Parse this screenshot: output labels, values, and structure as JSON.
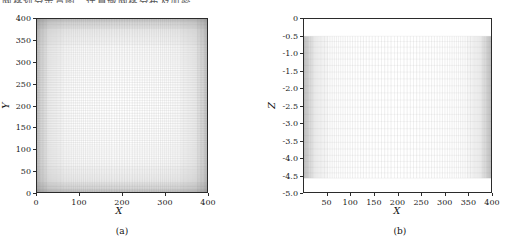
{
  "figure": {
    "top_cropped_text": "网格划分示意图，计算域网格分布及加密",
    "background": "#ffffff",
    "line_color": "#2b2b2b",
    "mesh_color": "#6b6b6b"
  },
  "chart_data": [
    {
      "type": "line",
      "panel": "a",
      "caption": "(a)",
      "title": "",
      "subtitle": "",
      "xlabel": "X",
      "ylabel": "Y",
      "xlim": [
        0,
        400
      ],
      "ylim": [
        0,
        400
      ],
      "xticks": [
        0,
        100,
        200,
        300,
        400
      ],
      "xtick_labels": [
        "0",
        "100",
        "200",
        "300",
        "400"
      ],
      "yticks": [
        0,
        50,
        100,
        150,
        200,
        250,
        300,
        350,
        400
      ],
      "ytick_labels": [
        "0",
        "50",
        "100",
        "150",
        "200",
        "250",
        "300",
        "350",
        "400"
      ],
      "grid": true,
      "legend": null,
      "description": "Structured computational mesh on the X-Y plane with strong clustering of grid lines toward all four domain boundaries.",
      "mesh": {
        "x_cells": 120,
        "y_cells": 120,
        "clustering": "both-edges",
        "stretch": 3.4
      }
    },
    {
      "type": "line",
      "panel": "b",
      "caption": "(b)",
      "title": "",
      "subtitle": "",
      "xlabel": "X",
      "ylabel": "Z",
      "xlim": [
        0,
        400
      ],
      "ylim": [
        -5.0,
        0.0
      ],
      "xticks": [
        50,
        100,
        150,
        200,
        250,
        300,
        350,
        400
      ],
      "xtick_labels": [
        "50",
        "100",
        "150",
        "200",
        "250",
        "300",
        "350",
        "400"
      ],
      "yticks": [
        0,
        -0.5,
        -1.0,
        -1.5,
        -2.0,
        -2.5,
        -3.0,
        -3.5,
        -4.0,
        -4.5,
        -5.0
      ],
      "ytick_labels": [
        "0",
        "-0.5",
        "-1.0",
        "-1.5",
        "-2.0",
        "-2.5",
        "-3.0",
        "-3.5",
        "-4.0",
        "-4.5",
        "-5.0"
      ],
      "grid": true,
      "legend": null,
      "description": "Structured computational mesh on the X-Z plane spanning z = -0.5 to z = -4.6, vertical grid lines clustered near x = 0 and x = 400.",
      "mesh": {
        "x_cells": 110,
        "z_cells": 22,
        "z_top": -0.5,
        "z_bottom": -4.6,
        "clustering": "both-edges",
        "stretch": 3.6
      }
    }
  ],
  "panel_a": {
    "caption": "(a)",
    "xlabel": "X",
    "ylabel": "Y",
    "xtick_labels": [
      "0",
      "100",
      "200",
      "300",
      "400"
    ],
    "ytick_labels": [
      "400",
      "350",
      "300",
      "250",
      "200",
      "150",
      "100",
      "50",
      "0"
    ]
  },
  "panel_b": {
    "caption": "(b)",
    "xlabel": "X",
    "ylabel": "Z",
    "xtick_labels": [
      "50",
      "100",
      "150",
      "200",
      "250",
      "300",
      "350",
      "400"
    ],
    "ytick_labels": [
      "0",
      "-0.5",
      "-1.0",
      "-1.5",
      "-2.0",
      "-2.5",
      "-3.0",
      "-3.5",
      "-4.0",
      "-4.5",
      "-5.0"
    ]
  }
}
